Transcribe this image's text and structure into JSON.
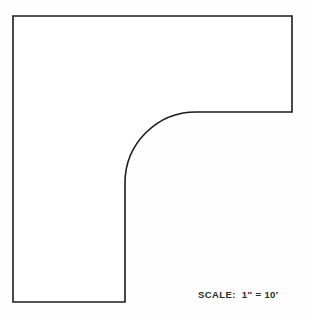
{
  "sheet": {
    "background_color": "#fefefe",
    "line_color": "#1c1c1c",
    "fill_color": "#ffffff"
  },
  "figure": {
    "name": "L-shaped plan with filleted inside corner",
    "type": "outline",
    "units": "pixels",
    "stroke_width": 1.6,
    "vertices": [
      {
        "x": 13,
        "y": 16
      },
      {
        "x": 292,
        "y": 16
      },
      {
        "x": 292,
        "y": 112
      },
      {
        "x": 196,
        "y": 112
      },
      {
        "x": 125,
        "y": 183
      },
      {
        "x": 125,
        "y": 302
      },
      {
        "x": 13,
        "y": 302
      }
    ],
    "arc": {
      "start": {
        "x": 196,
        "y": 112
      },
      "end": {
        "x": 125,
        "y": 183
      },
      "radius": 71,
      "sweep": "counterclockwise",
      "center": {
        "x": 196,
        "y": 183
      }
    },
    "path_d": "M 13 16 L 292 16 L 292 112 L 196 112 A 71 71 0 0 0 125 183 L 125 302 L 13 302 Z"
  },
  "annotations": {
    "scale": {
      "label": "SCALE:",
      "value": "1″ = 10′",
      "ratio_inches": 1,
      "ratio_feet": 10
    }
  }
}
